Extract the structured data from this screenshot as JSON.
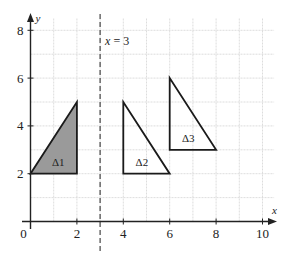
{
  "diagram": {
    "type": "coordinate-grid-reflection",
    "axes": {
      "x_label": "x",
      "y_label": "y",
      "x_ticks": [
        {
          "value": 0,
          "label": "0"
        },
        {
          "value": 2,
          "label": "2"
        },
        {
          "value": 4,
          "label": "4"
        },
        {
          "value": 6,
          "label": "6"
        },
        {
          "value": 8,
          "label": "8"
        },
        {
          "value": 10,
          "label": "10"
        }
      ],
      "y_ticks": [
        {
          "value": 2,
          "label": "2"
        },
        {
          "value": 4,
          "label": "4"
        },
        {
          "value": 6,
          "label": "6"
        },
        {
          "value": 8,
          "label": "8"
        }
      ],
      "xlim": [
        0,
        10.5
      ],
      "ylim": [
        0,
        8.5
      ],
      "grid": true
    },
    "mirror_line": {
      "x": 3,
      "label_var": "x",
      "label_eq": " = 3",
      "style": "dashed"
    },
    "triangles": [
      {
        "id": "t1",
        "label": "Δ1",
        "vertices": [
          [
            0,
            2
          ],
          [
            2,
            2
          ],
          [
            2,
            5
          ]
        ],
        "fill": "#9a9a9a",
        "label_pos": [
          1.2,
          2.5
        ]
      },
      {
        "id": "t2",
        "label": "Δ2",
        "vertices": [
          [
            4,
            2
          ],
          [
            6,
            2
          ],
          [
            4,
            5
          ]
        ],
        "fill": "none",
        "label_pos": [
          4.8,
          2.5
        ]
      },
      {
        "id": "t3",
        "label": "Δ3",
        "vertices": [
          [
            6,
            3
          ],
          [
            8,
            3
          ],
          [
            6,
            6
          ]
        ],
        "fill": "none",
        "label_pos": [
          6.8,
          3.5
        ]
      }
    ],
    "colors": {
      "axis": "#222222",
      "grid": "#d4d4d4",
      "outline": "#1a1a1a",
      "shade": "#9a9a9a"
    }
  }
}
